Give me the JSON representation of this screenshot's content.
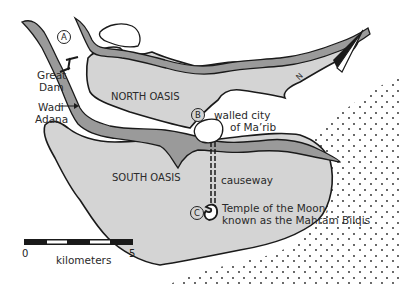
{
  "map": {
    "colors": {
      "oasis_fill": "#d4d4d4",
      "river_fill": "#9a9a9a",
      "outline": "#1a1a1a",
      "desert_dots": "#222222",
      "background": "#ffffff"
    },
    "regions": {
      "north_oasis": "NORTH OASIS",
      "south_oasis": "SOUTH OASIS"
    },
    "markers": [
      {
        "id": "A",
        "label": "A"
      },
      {
        "id": "B",
        "label": "B"
      },
      {
        "id": "C",
        "label": "C"
      }
    ],
    "labels": {
      "great_dam_line1": "Great",
      "great_dam_line2": "Dam",
      "wadi_line1": "Wadi",
      "wadi_line2": "Adana",
      "city_line1": "walled city",
      "city_line2": "of Ma’rib",
      "causeway": "causeway",
      "temple_line1": "Temple of the Moon,",
      "temple_line2": "known as the Mahram Bilqis"
    },
    "north_arrow": {
      "label": "N"
    },
    "scale_bar": {
      "start": "0",
      "end": "5",
      "unit": "kilometers"
    }
  }
}
